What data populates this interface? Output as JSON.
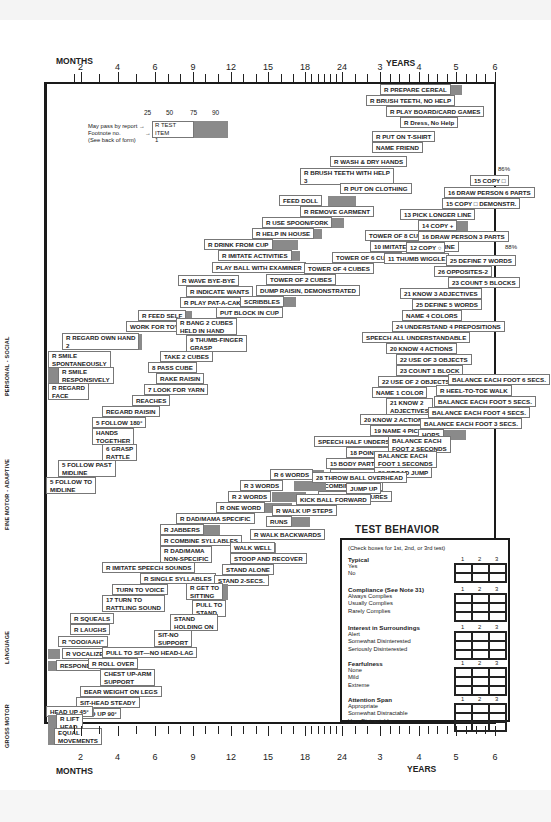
{
  "axis": {
    "months_label": "MONTHS",
    "years_label": "YEARS",
    "ticks": [
      {
        "x": 73.5,
        "label": ""
      },
      {
        "x": 80.5,
        "label": "2"
      },
      {
        "x": 99,
        "label": ""
      },
      {
        "x": 117.5,
        "label": "4"
      },
      {
        "x": 136,
        "label": ""
      },
      {
        "x": 155,
        "label": "6"
      },
      {
        "x": 168,
        "label": ""
      },
      {
        "x": 180,
        "label": ""
      },
      {
        "x": 193,
        "label": "9"
      },
      {
        "x": 205,
        "label": ""
      },
      {
        "x": 218,
        "label": ""
      },
      {
        "x": 231,
        "label": "12"
      },
      {
        "x": 243,
        "label": ""
      },
      {
        "x": 256,
        "label": ""
      },
      {
        "x": 268,
        "label": "15"
      },
      {
        "x": 281,
        "label": ""
      },
      {
        "x": 293,
        "label": ""
      },
      {
        "x": 305,
        "label": "18"
      },
      {
        "x": 311,
        "label": ""
      },
      {
        "x": 318,
        "label": ""
      },
      {
        "x": 324,
        "label": ""
      },
      {
        "x": 330,
        "label": ""
      },
      {
        "x": 336,
        "label": ""
      },
      {
        "x": 342,
        "label": "24"
      },
      {
        "x": 355,
        "label": ""
      },
      {
        "x": 367,
        "label": ""
      },
      {
        "x": 380,
        "label": "3"
      },
      {
        "x": 390,
        "label": ""
      },
      {
        "x": 399,
        "label": ""
      },
      {
        "x": 409,
        "label": ""
      },
      {
        "x": 419,
        "label": "4"
      },
      {
        "x": 428,
        "label": ""
      },
      {
        "x": 437,
        "label": ""
      },
      {
        "x": 447,
        "label": ""
      },
      {
        "x": 456,
        "label": "5"
      },
      {
        "x": 466,
        "label": ""
      },
      {
        "x": 476,
        "label": ""
      },
      {
        "x": 485,
        "label": ""
      },
      {
        "x": 495,
        "label": "6"
      }
    ]
  },
  "domains": {
    "personal_social": "PERSONAL - SOCIAL",
    "fine_motor": "FINE MOTOR - ADAPTIVE",
    "language": "LANGUAGE",
    "gross_motor": "GROSS MOTOR"
  },
  "legend": {
    "percentiles": [
      "25",
      "50",
      "75",
      "90"
    ],
    "pass_by_report": "May pass by report →",
    "footnote": "Footnote no.",
    "see_back": "(See back of form)",
    "arrow": "→",
    "sample_label": "R TEST ITEM",
    "sample_note": "1"
  },
  "percent_marks": [
    "86%",
    "88%"
  ],
  "items": [
    {
      "t": "R PREPARE CEREAL",
      "x": 380,
      "y": 84,
      "w": 55,
      "b": 434,
      "bw": 28
    },
    {
      "t": "R BRUSH TEETH, NO HELP",
      "x": 366,
      "y": 95,
      "w": 63,
      "b": 418,
      "bw": 32
    },
    {
      "t": "R PLAY BOARD/CARD GAMES",
      "x": 386,
      "y": 106,
      "w": 64,
      "b": 432,
      "bw": 30
    },
    {
      "t": "R Dress, No Help",
      "x": 400,
      "y": 117,
      "w": 48,
      "b": 430,
      "bw": 24
    },
    {
      "t": "R PUT ON T-SHIRT",
      "x": 372,
      "y": 131,
      "w": 56,
      "b": 398,
      "bw": 30
    },
    {
      "t": "NAME FRIEND",
      "x": 372,
      "y": 142,
      "w": 43,
      "b": 398,
      "bw": 20
    },
    {
      "t": "R WASH & DRY HANDS",
      "x": 330,
      "y": 156,
      "w": 68,
      "b": 372,
      "bw": 32
    },
    {
      "t": "R BRUSH TEETH WITH HELP\n3",
      "x": 300,
      "y": 168,
      "w": 76,
      "b": 352,
      "bw": 30,
      "two": true
    },
    {
      "t": "R PUT ON CLOTHING",
      "x": 340,
      "y": 183,
      "w": 60,
      "b": 372,
      "bw": 34
    },
    {
      "t": "FEED DOLL",
      "x": 279,
      "y": 195,
      "w": 50,
      "b": 328,
      "bw": 28
    },
    {
      "t": "R REMOVE GARMENT",
      "x": 300,
      "y": 206,
      "w": 62,
      "b": 334,
      "bw": 28
    },
    {
      "t": "R USE SPOON/FORK",
      "x": 262,
      "y": 217,
      "w": 58,
      "b": 314,
      "bw": 30
    },
    {
      "t": "R HELP IN HOUSE",
      "x": 252,
      "y": 228,
      "w": 54,
      "b": 290,
      "bw": 32
    },
    {
      "t": "R DRINK FROM CUP",
      "x": 204,
      "y": 239,
      "w": 72,
      "b": 272,
      "bw": 26
    },
    {
      "t": "R IMITATE ACTIVITIES",
      "x": 218,
      "y": 250,
      "w": 70,
      "b": 264,
      "bw": 36
    },
    {
      "t": "PLAY BALL WITH EXAMINER",
      "x": 212,
      "y": 262,
      "w": 86,
      "b": 268,
      "bw": 34
    },
    {
      "t": "R WAVE BYE-BYE",
      "x": 178,
      "y": 275,
      "w": 54,
      "b": 200,
      "bw": 32
    },
    {
      "t": "R INDICATE WANTS",
      "x": 186,
      "y": 286,
      "w": 56,
      "b": 210,
      "bw": 30
    },
    {
      "t": "R PLAY PAT-A-CAKE",
      "x": 180,
      "y": 297,
      "w": 62,
      "b": 222,
      "bw": 24
    },
    {
      "t": "R FEED SELF",
      "x": 138,
      "y": 310,
      "w": 44,
      "b": 164,
      "bw": 28
    },
    {
      "t": "WORK FOR TOY",
      "x": 126,
      "y": 321,
      "w": 50,
      "b": 148,
      "bw": 24
    },
    {
      "t": "R REGARD OWN HAND\n2",
      "x": 62,
      "y": 333,
      "w": 68,
      "b": 108,
      "bw": 34,
      "two": true
    },
    {
      "t": "R SMILE\nSPONTANEOUSLY",
      "x": 48,
      "y": 351,
      "w": 66,
      "b": 72,
      "bw": 26,
      "two": true
    },
    {
      "t": "R SMILE\nRESPONSIVELY",
      "x": 58,
      "y": 367,
      "w": 70,
      "b": 48,
      "bw": 14,
      "two": true
    },
    {
      "t": "R REGARD\nFACE",
      "x": 48,
      "y": 383,
      "w": 34,
      "b": 48,
      "bw": 18,
      "two": true
    },
    {
      "t": "TOWER OF 8 CUBES",
      "x": 365,
      "y": 230,
      "w": 58,
      "b": 400,
      "bw": 36
    },
    {
      "t": "10 IMITATE VERTICAL LINE",
      "x": 370,
      "y": 241,
      "w": 70,
      "b": 400,
      "bw": 40
    },
    {
      "t": "TOWER OF 6 CUBES",
      "x": 332,
      "y": 252,
      "w": 56,
      "b": 368,
      "bw": 28
    },
    {
      "t": "TOWER OF 4 CUBES",
      "x": 304,
      "y": 263,
      "w": 58,
      "b": 336,
      "bw": 30
    },
    {
      "t": "TOWER OF 2 CUBES",
      "x": 266,
      "y": 274,
      "w": 58,
      "b": 300,
      "bw": 30
    },
    {
      "t": "DUMP RAISIN, DEMONSTRATED",
      "x": 256,
      "y": 285,
      "w": 90,
      "b": 292,
      "bw": 44
    },
    {
      "t": "SCRIBBLES",
      "x": 240,
      "y": 296,
      "w": 40,
      "b": 260,
      "bw": 36
    },
    {
      "t": "PUT BLOCK IN CUP",
      "x": 216,
      "y": 307,
      "w": 60,
      "b": 250,
      "bw": 26
    },
    {
      "t": "R BANG 2 CUBES\nHELD IN HAND",
      "x": 176,
      "y": 318,
      "w": 56,
      "b": 200,
      "bw": 28,
      "two": true
    },
    {
      "t": "9 THUMB-FINGER\nGRASP",
      "x": 186,
      "y": 335,
      "w": 50,
      "b": 206,
      "bw": 26,
      "two": true
    },
    {
      "t": "TAKE 2 CUBES",
      "x": 160,
      "y": 351,
      "w": 48,
      "b": 180,
      "bw": 22
    },
    {
      "t": "8 PASS CUBE",
      "x": 148,
      "y": 362,
      "w": 44,
      "b": 176,
      "bw": 16
    },
    {
      "t": "RAKE RAISIN",
      "x": 156,
      "y": 373,
      "w": 42,
      "b": 172,
      "bw": 18
    },
    {
      "t": "7 LOOK FOR YARN",
      "x": 144,
      "y": 384,
      "w": 54,
      "b": 172,
      "bw": 14
    },
    {
      "t": "REACHES",
      "x": 132,
      "y": 395,
      "w": 36,
      "b": 148,
      "bw": 14
    },
    {
      "t": "REGARD RAISIN",
      "x": 102,
      "y": 406,
      "w": 48,
      "b": 134,
      "bw": 16
    },
    {
      "t": "5 FOLLOW 180°",
      "x": 92,
      "y": 417,
      "w": 48,
      "b": 120,
      "bw": 22
    },
    {
      "t": "HANDS\nTOGETHER",
      "x": 92,
      "y": 428,
      "w": 36,
      "b": 106,
      "bw": 22,
      "two": true
    },
    {
      "t": "6 GRASP\nRATTLE",
      "x": 102,
      "y": 444,
      "w": 36,
      "b": 110,
      "bw": 16,
      "two": true
    },
    {
      "t": "5 FOLLOW PAST\nMIDLINE",
      "x": 58,
      "y": 460,
      "w": 58,
      "b": 88,
      "bw": 18,
      "two": true
    },
    {
      "t": "5 FOLLOW TO\nMIDLINE",
      "x": 46,
      "y": 477,
      "w": 46,
      "b": 52,
      "bw": 24,
      "two": true
    },
    {
      "t": "15 COPY □",
      "x": 470,
      "y": 175,
      "w": 36,
      "b": 488,
      "bw": 8
    },
    {
      "t": "16 DRAW PERSON 6 PARTS",
      "x": 444,
      "y": 187,
      "w": 64,
      "b": 480,
      "bw": 20
    },
    {
      "t": "15 COPY □ DEMONSTR.",
      "x": 442,
      "y": 198,
      "w": 62,
      "b": 474,
      "bw": 20
    },
    {
      "t": "13 PICK LONGER LINE",
      "x": 400,
      "y": 209,
      "w": 60,
      "b": 428,
      "bw": 40
    },
    {
      "t": "14 COPY +",
      "x": 418,
      "y": 220,
      "w": 38,
      "b": 432,
      "bw": 36
    },
    {
      "t": "16 DRAW PERSON 3 PARTS",
      "x": 418,
      "y": 231,
      "w": 70,
      "b": 440,
      "bw": 30
    },
    {
      "t": "12 COPY ○",
      "x": 406,
      "y": 242,
      "w": 34,
      "b": 420,
      "bw": 24
    },
    {
      "t": "11 THUMB WIGGLE",
      "x": 384,
      "y": 253,
      "w": 56,
      "b": 408,
      "bw": 26
    },
    {
      "t": "25 DEFINE 7 WORDS",
      "x": 446,
      "y": 255,
      "w": 50,
      "b": 470,
      "bw": 24
    },
    {
      "t": "26 OPPOSITES-2",
      "x": 434,
      "y": 266,
      "w": 58,
      "b": 460,
      "bw": 32
    },
    {
      "t": "23 COUNT 5 BLOCKS",
      "x": 448,
      "y": 277,
      "w": 54,
      "b": 460,
      "bw": 36
    },
    {
      "t": "21 KNOW 3 ADJECTIVES",
      "x": 400,
      "y": 288,
      "w": 64,
      "b": 420,
      "bw": 44
    },
    {
      "t": "25 DEFINE 5 WORDS",
      "x": 412,
      "y": 299,
      "w": 62,
      "b": 436,
      "bw": 30
    },
    {
      "t": "NAME 4 COLORS",
      "x": 402,
      "y": 310,
      "w": 50,
      "b": 420,
      "bw": 36
    },
    {
      "t": "24 UNDERSTAND 4 PREPOSITIONS",
      "x": 392,
      "y": 321,
      "w": 94,
      "b": 410,
      "bw": 40
    },
    {
      "t": "SPEECH ALL UNDERSTANDABLE",
      "x": 362,
      "y": 332,
      "w": 92,
      "b": 384,
      "bw": 30
    },
    {
      "t": "20 KNOW 4 ACTIONS",
      "x": 386,
      "y": 343,
      "w": 60,
      "b": 410,
      "bw": 28
    },
    {
      "t": "22 USE OF 3 OBJECTS",
      "x": 396,
      "y": 354,
      "w": 64,
      "b": 402,
      "bw": 30
    },
    {
      "t": "23 COUNT 1 BLOCK",
      "x": 396,
      "y": 365,
      "w": 54,
      "b": 406,
      "bw": 28
    },
    {
      "t": "22 USE OF 2 OBJECTS",
      "x": 378,
      "y": 376,
      "w": 62,
      "b": 394,
      "bw": 30
    },
    {
      "t": "NAME 1 COLOR",
      "x": 372,
      "y": 387,
      "w": 48,
      "b": 394,
      "bw": 28
    },
    {
      "t": "21 KNOW 2\nADJECTIVES",
      "x": 386,
      "y": 398,
      "w": 44,
      "b": 392,
      "bw": 30,
      "two": true
    },
    {
      "t": "20 KNOW 2 ACTIONS",
      "x": 360,
      "y": 414,
      "w": 62,
      "b": 374,
      "bw": 36
    },
    {
      "t": "19 NAME 4 PICTURES",
      "x": 370,
      "y": 425,
      "w": 58,
      "b": 386,
      "bw": 30
    },
    {
      "t": "SPEECH HALF UNDERSTANDABLE",
      "x": 314,
      "y": 436,
      "w": 94,
      "b": 352,
      "bw": 30
    },
    {
      "t": "18 POINT 4 PICTURES",
      "x": 346,
      "y": 447,
      "w": 62,
      "b": 368,
      "bw": 20
    },
    {
      "t": "15 BODY PARTS-6",
      "x": 326,
      "y": 458,
      "w": 58,
      "b": 354,
      "bw": 20
    },
    {
      "t": "18 NAME 1 PICTURE",
      "x": 330,
      "y": 469,
      "w": 56,
      "b": 352,
      "bw": 30
    },
    {
      "t": "R COMBINE WORDS",
      "x": 314,
      "y": 480,
      "w": 58,
      "b": 334,
      "bw": 36
    },
    {
      "t": "18 POINT 2 PICTURES",
      "x": 318,
      "y": 491,
      "w": 60,
      "b": 348,
      "bw": 22
    },
    {
      "t": "R 6 WORDS",
      "x": 270,
      "y": 469,
      "w": 44,
      "b": 290,
      "bw": 34
    },
    {
      "t": "R 3 WORDS",
      "x": 240,
      "y": 480,
      "w": 54,
      "b": 294,
      "bw": 32
    },
    {
      "t": "R 2 WORDS",
      "x": 228,
      "y": 491,
      "w": 44,
      "b": 272,
      "bw": 34
    },
    {
      "t": "R ONE WORD",
      "x": 216,
      "y": 502,
      "w": 44,
      "b": 260,
      "bw": 32
    },
    {
      "t": "R DAD/MAMA SPECIFIC",
      "x": 176,
      "y": 513,
      "w": 68,
      "b": 204,
      "bw": 48
    },
    {
      "t": "R JABBERS",
      "x": 160,
      "y": 524,
      "w": 34,
      "b": 194,
      "bw": 26
    },
    {
      "t": "R COMBINE SYLLABLES",
      "x": 160,
      "y": 535,
      "w": 68,
      "b": 178,
      "bw": 34
    },
    {
      "t": "R DAD/MAMA\nNON-SPECIFIC",
      "x": 160,
      "y": 546,
      "w": 48,
      "b": 176,
      "bw": 34,
      "two": true
    },
    {
      "t": "R IMITATE SPEECH SOUNDS",
      "x": 102,
      "y": 562,
      "w": 82,
      "b": 148,
      "bw": 36
    },
    {
      "t": "R SINGLE SYLLABLES",
      "x": 140,
      "y": 573,
      "w": 58,
      "b": 160,
      "bw": 20
    },
    {
      "t": "TURN TO VOICE",
      "x": 112,
      "y": 584,
      "w": 52,
      "b": 144,
      "bw": 24
    },
    {
      "t": "17 TURN TO\nRATTLING SOUND",
      "x": 102,
      "y": 595,
      "w": 52,
      "b": 116,
      "bw": 24,
      "two": true
    },
    {
      "t": "R SQUEALS",
      "x": 70,
      "y": 613,
      "w": 36,
      "b": 96,
      "bw": 18
    },
    {
      "t": "R LAUGHS",
      "x": 70,
      "y": 624,
      "w": 32,
      "b": 88,
      "bw": 18
    },
    {
      "t": "R \"OOO/AAH\"",
      "x": 58,
      "y": 636,
      "w": 38,
      "b": 72,
      "bw": 14
    },
    {
      "t": "R VOCALIZES",
      "x": 62,
      "y": 648,
      "w": 46,
      "b": 48,
      "bw": 12
    },
    {
      "t": "RESPOND TO BELL",
      "x": 56,
      "y": 660,
      "w": 60,
      "b": 48,
      "bw": 8
    },
    {
      "t": "BALANCE EACH FOOT 6 SECS.",
      "x": 448,
      "y": 374,
      "w": 80,
      "b": 500,
      "bw": 0
    },
    {
      "t": "R HEEL-TO-TOE WALK",
      "x": 436,
      "y": 385,
      "w": 62,
      "b": 476,
      "bw": 24
    },
    {
      "t": "BALANCE EACH FOOT 5 SECS.",
      "x": 434,
      "y": 396,
      "w": 84,
      "b": 480,
      "bw": 30
    },
    {
      "t": "BALANCE EACH FOOT 4 SECS.",
      "x": 428,
      "y": 407,
      "w": 80,
      "b": 462,
      "bw": 30
    },
    {
      "t": "BALANCE EACH FOOT 3 SECS.",
      "x": 420,
      "y": 418,
      "w": 80,
      "b": 452,
      "bw": 26
    },
    {
      "t": "HOPS",
      "x": 418,
      "y": 429,
      "w": 26,
      "b": 444,
      "bw": 22
    },
    {
      "t": "BALANCE EACH\nFOOT 2 SECONDS",
      "x": 388,
      "y": 436,
      "w": 50,
      "b": 420,
      "bw": 24,
      "two": true
    },
    {
      "t": "BALANCE EACH\nFOOT 1 SECONDS",
      "x": 374,
      "y": 451,
      "w": 50,
      "b": 400,
      "bw": 22,
      "two": true
    },
    {
      "t": "29 BROAD JUMP",
      "x": 374,
      "y": 467,
      "w": 44,
      "b": 396,
      "bw": 22
    },
    {
      "t": "28 THROW BALL OVERHEAD",
      "x": 312,
      "y": 472,
      "w": 70,
      "b": 350,
      "bw": 30
    },
    {
      "t": "JUMP UP",
      "x": 346,
      "y": 483,
      "w": 30,
      "b": 350,
      "bw": 26
    },
    {
      "t": "KICK BALL FORWARD",
      "x": 296,
      "y": 494,
      "w": 60,
      "b": 316,
      "bw": 42
    },
    {
      "t": "R WALK UP STEPS",
      "x": 272,
      "y": 505,
      "w": 56,
      "b": 300,
      "bw": 28
    },
    {
      "t": "RUNS",
      "x": 266,
      "y": 516,
      "w": 54,
      "b": 272,
      "bw": 38
    },
    {
      "t": "R WALK BACKWARDS",
      "x": 250,
      "y": 529,
      "w": 58,
      "b": 272,
      "bw": 28
    },
    {
      "t": "WALK WELL",
      "x": 230,
      "y": 542,
      "w": 40,
      "b": 250,
      "bw": 26
    },
    {
      "t": "STOOP AND RECOVER",
      "x": 230,
      "y": 553,
      "w": 60,
      "b": 252,
      "bw": 26
    },
    {
      "t": "STAND ALONE",
      "x": 222,
      "y": 564,
      "w": 44,
      "b": 240,
      "bw": 32
    },
    {
      "t": "STAND 2-SECS.",
      "x": 214,
      "y": 575,
      "w": 44,
      "b": 230,
      "bw": 18
    },
    {
      "t": "R GET TO\nSITTING",
      "x": 186,
      "y": 583,
      "w": 36,
      "b": 208,
      "bw": 20,
      "two": true
    },
    {
      "t": "PULL TO\nSTAND",
      "x": 192,
      "y": 600,
      "w": 30,
      "b": 206,
      "bw": 18,
      "two": true
    },
    {
      "t": "STAND\nHOLDING ON",
      "x": 170,
      "y": 614,
      "w": 40,
      "b": 184,
      "bw": 14,
      "two": true
    },
    {
      "t": "SIT-NO\nSUPPORT",
      "x": 154,
      "y": 630,
      "w": 36,
      "b": 166,
      "bw": 22,
      "two": true
    },
    {
      "t": "PULL TO SIT—NO HEAD-LAG",
      "x": 102,
      "y": 647,
      "w": 84,
      "b": 132,
      "bw": 30
    },
    {
      "t": "R ROLL OVER",
      "x": 88,
      "y": 658,
      "w": 44,
      "b": 116,
      "bw": 22
    },
    {
      "t": "CHEST UP-ARM\nSUPPORT",
      "x": 100,
      "y": 669,
      "w": 50,
      "b": 112,
      "bw": 26,
      "two": true
    },
    {
      "t": "BEAR WEIGHT ON LEGS",
      "x": 80,
      "y": 686,
      "w": 72,
      "b": 120,
      "bw": 10
    },
    {
      "t": "SIT-HEAD STEADY",
      "x": 76,
      "y": 697,
      "w": 54,
      "b": 98,
      "bw": 18
    },
    {
      "t": "HEAD UP 90°",
      "x": 74,
      "y": 708,
      "w": 40,
      "b": 100,
      "bw": 14
    },
    {
      "t": "HEAD UP 45°",
      "x": 46,
      "y": 706,
      "w": 40,
      "b": 80,
      "bw": 14
    },
    {
      "t": "R LIFT\nHEAD",
      "x": 56,
      "y": 714,
      "w": 30,
      "b": 48,
      "bw": 10,
      "two": true
    },
    {
      "t": "EQUAL\nMOVEMENTS",
      "x": 54,
      "y": 728,
      "w": 44,
      "b": 48,
      "bw": 8,
      "two": true
    }
  ],
  "test_behavior": {
    "title": "TEST BEHAVIOR",
    "note": "(Check boxes for 1st, 2nd, or 3rd test)",
    "columns": [
      "1",
      "2",
      "3"
    ],
    "sections": [
      {
        "heading": "Typical",
        "options": [
          "Yes",
          "No"
        ]
      },
      {
        "heading": "Compliance (See Note 31)",
        "options": [
          "Always Complies",
          "Usually Complies",
          "Rarely Complies"
        ]
      },
      {
        "heading": "Interest in Surroundings",
        "options": [
          "Alert",
          "Somewhat Disinterested",
          "Seriously Disinterested"
        ]
      },
      {
        "heading": "Fearfulness",
        "options": [
          "None",
          "Mild",
          "Extreme"
        ]
      },
      {
        "heading": "Attention Span",
        "options": [
          "Appropriate",
          "Somewhat Distractable",
          "Very Distractable"
        ]
      }
    ]
  }
}
